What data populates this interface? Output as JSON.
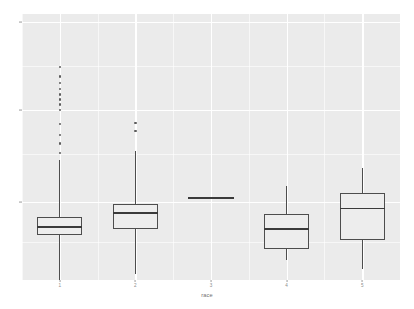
{
  "chart_data": {
    "type": "boxplot",
    "title": "",
    "xlabel": "race",
    "ylabel": "",
    "grid": true,
    "legend": false,
    "categories": [
      "1",
      "2",
      "3",
      "4",
      "5"
    ],
    "y_ticks": [
      {
        "label": "40",
        "pixel_y": 22
      },
      {
        "label": "30",
        "pixel_y": 110
      },
      {
        "label": "20",
        "pixel_y": 202
      }
    ],
    "ylim": [
      14.8,
      47.5
    ],
    "boxes": [
      {
        "category": "1",
        "min": 13.0,
        "q1": 20.3,
        "median": 21.4,
        "q3": 22.6,
        "max": 29.5,
        "outliers": [
          30.4,
          31.6,
          32.6,
          34.0,
          35.7,
          36.4,
          37.0,
          37.6,
          38.3,
          39.0,
          39.8,
          41.0,
          10.5,
          12.0
        ],
        "degenerate": false
      },
      {
        "category": "2",
        "min": 15.5,
        "q1": 21.1,
        "median": 23.2,
        "q3": 24.2,
        "max": 30.6,
        "outliers": [
          33.1,
          34.1
        ],
        "degenerate": false
      },
      {
        "category": "3",
        "min": 25.0,
        "q1": 25.0,
        "median": 25.0,
        "q3": 25.0,
        "max": 25.0,
        "outliers": [],
        "degenerate": true
      },
      {
        "category": "4",
        "min": 17.2,
        "q1": 18.6,
        "median": 21.2,
        "q3": 22.9,
        "max": 26.3,
        "outliers": [],
        "degenerate": false
      },
      {
        "category": "5",
        "min": 16.2,
        "q1": 19.7,
        "median": 23.7,
        "q3": 25.5,
        "max": 28.6,
        "outliers": [],
        "degenerate": false
      }
    ],
    "colors": {
      "panel_background": "#ebebeb",
      "gridline": "#ffffff",
      "box_outline": "#4d4d4d",
      "box_fill": "#ededed",
      "median_line": "#3a3a3a",
      "outlier_point": "#3f3f3f",
      "axis_text": "#8c8c8c",
      "axis_title": "#6e6e6e",
      "page_background": "#ffffff"
    }
  }
}
